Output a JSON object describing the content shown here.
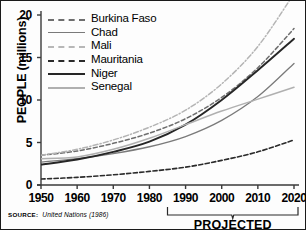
{
  "figure": {
    "ylabel": "PEOPLE (millions)",
    "projected_label": "PROJECTED",
    "source_key": "SOURCE:",
    "source_value": "United Nations (1986)"
  },
  "chart_data": {
    "type": "line",
    "title": "",
    "xlabel": "",
    "ylabel": "PEOPLE (millions)",
    "xlim": [
      1950,
      2020
    ],
    "ylim": [
      0,
      20
    ],
    "xticks": [
      1950,
      1960,
      1970,
      1980,
      1990,
      2000,
      2010,
      2020
    ],
    "yticks": [
      0,
      5,
      10,
      15,
      20
    ],
    "grid": false,
    "legend_position": "upper-left-inside",
    "annotations": [
      {
        "text": "PROJECTED",
        "x_range": [
          1985,
          2020
        ]
      }
    ],
    "source": "United Nations (1986)",
    "x": [
      1950,
      1960,
      1970,
      1980,
      1990,
      2000,
      2010,
      2020
    ],
    "series": [
      {
        "name": "Burkina Faso",
        "style": "dashed",
        "color": "#6e6e6e",
        "width": 1.5,
        "values": [
          3.5,
          4.0,
          4.9,
          6.1,
          7.8,
          10.3,
          13.8,
          18.4
        ]
      },
      {
        "name": "Chad",
        "style": "solid",
        "color": "#7a7a7a",
        "width": 1.3,
        "values": [
          2.7,
          3.1,
          3.7,
          4.5,
          5.7,
          7.6,
          10.4,
          14.3
        ]
      },
      {
        "name": "Mali",
        "style": "dash-dot",
        "color": "#b4b4b4",
        "width": 1.5,
        "values": [
          3.5,
          4.2,
          5.3,
          6.8,
          8.8,
          11.9,
          16.3,
          22.5
        ]
      },
      {
        "name": "Mauritania",
        "style": "dashed",
        "color": "#2b2b2b",
        "width": 1.6,
        "values": [
          0.7,
          0.9,
          1.2,
          1.6,
          2.1,
          2.9,
          3.9,
          5.3
        ]
      },
      {
        "name": "Niger",
        "style": "solid",
        "color": "#262626",
        "width": 1.9,
        "values": [
          2.4,
          3.0,
          3.9,
          5.1,
          7.1,
          10.0,
          13.5,
          17.2
        ]
      },
      {
        "name": "Senegal",
        "style": "solid",
        "color": "#b0b0b0",
        "width": 1.5,
        "values": [
          3.1,
          3.3,
          4.2,
          5.5,
          7.1,
          8.7,
          10.1,
          11.5
        ]
      }
    ]
  }
}
